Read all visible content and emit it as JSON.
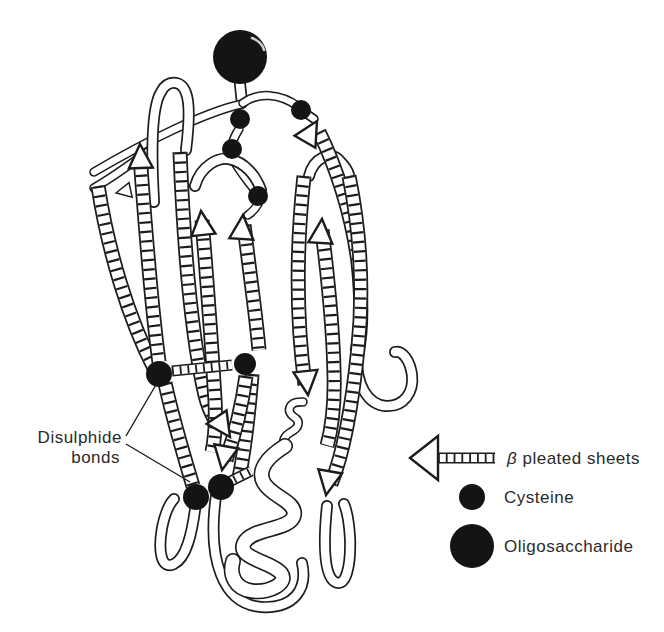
{
  "figure_type": "protein-tertiary-structure-ribbon-diagram",
  "annotations": {
    "disulphide_label": {
      "line1": "Disulphide",
      "line2": "bonds"
    }
  },
  "legend": {
    "items": [
      {
        "icon": "beta-strand-arrow",
        "label": "β pleated sheets"
      },
      {
        "icon": "cysteine-circle",
        "label": "Cysteine"
      },
      {
        "icon": "oligosaccharide-circle",
        "label": "Oligosaccharide"
      }
    ]
  },
  "structure": {
    "cysteine_residues_shown": 8,
    "disulphide_bonds_shown": 2,
    "oligosaccharides_shown": 1,
    "beta_strands_shown": 12
  },
  "colors": {
    "ink": "#1c1c1c",
    "paper": "#ffffff",
    "dot": "#141414",
    "text": "#2b2b2b"
  }
}
